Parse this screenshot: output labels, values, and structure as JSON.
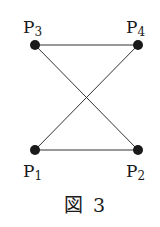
{
  "diagram": {
    "caption": "図 3",
    "points": [
      {
        "id": "P1",
        "letter": "P",
        "sub": "1",
        "x": 35,
        "y": 150
      },
      {
        "id": "P2",
        "letter": "P",
        "sub": "2",
        "x": 138,
        "y": 150
      },
      {
        "id": "P3",
        "letter": "P",
        "sub": "3",
        "x": 35,
        "y": 45
      },
      {
        "id": "P4",
        "letter": "P",
        "sub": "4",
        "x": 138,
        "y": 45
      }
    ],
    "edges": [
      [
        "P3",
        "P4"
      ],
      [
        "P1",
        "P2"
      ],
      [
        "P3",
        "P2"
      ],
      [
        "P1",
        "P4"
      ]
    ],
    "colors": {
      "line": "#333333",
      "point": "#1a1a1a"
    }
  }
}
